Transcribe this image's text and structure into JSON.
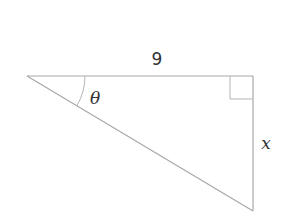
{
  "diagram": {
    "type": "right-triangle",
    "labels": {
      "top_side": "9",
      "angle": "θ",
      "right_side": "x"
    },
    "vertices": {
      "left": [
        27,
        76
      ],
      "top_right": [
        253,
        76
      ],
      "bottom": [
        253,
        211
      ]
    },
    "right_angle_at": "top_right",
    "angle_marked_at": "left",
    "colors": {
      "lines": "#a8a8a8",
      "text": "#333333",
      "background": "#ffffff"
    }
  }
}
